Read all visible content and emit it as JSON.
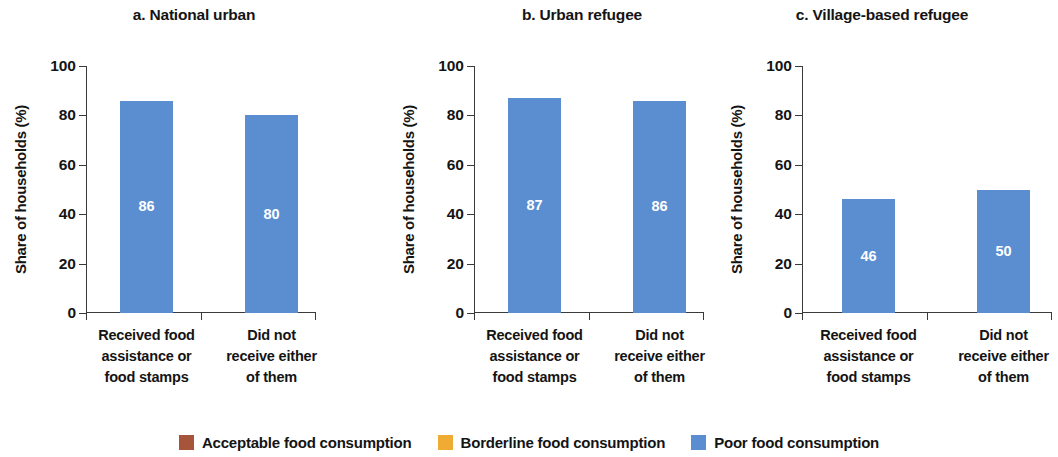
{
  "chart_data": {
    "type": "bar",
    "subtype": "stacked-100-percent",
    "title": "",
    "panels": [
      {
        "label": "a. National urban",
        "ylabel": "Share of households (%)",
        "categories": [
          "Received food\nassistance or\nfood stamps",
          "Did not\nreceive either\nof them"
        ],
        "series": [
          {
            "name": "Acceptable food consumption",
            "values": [
              4,
              8
            ]
          },
          {
            "name": "Borderline food consumption",
            "values": [
              10,
              12
            ]
          },
          {
            "name": "Poor food consumption",
            "values": [
              86,
              80
            ]
          }
        ]
      },
      {
        "label": "b. Urban refugee",
        "ylabel": "Share of households (%)",
        "categories": [
          "Received food\nassistance or\nfood stamps",
          "Did not\nreceive either\nof them"
        ],
        "series": [
          {
            "name": "Acceptable food consumption",
            "values": [
              6,
              7
            ]
          },
          {
            "name": "Borderline food consumption",
            "values": [
              8,
              7
            ]
          },
          {
            "name": "Poor food consumption",
            "values": [
              87,
              86
            ]
          }
        ]
      },
      {
        "label": "c. Village-based refugee",
        "ylabel": "Share of households (%)",
        "categories": [
          "Received food\nassistance or\nfood stamps",
          "Did not\nreceive either\nof them"
        ],
        "series": [
          {
            "name": "Acceptable food consumption",
            "values": [
              34,
              46
            ]
          },
          {
            "name": "Borderline food consumption",
            "values": [
              19,
              4
            ]
          },
          {
            "name": "Poor food consumption",
            "values": [
              46,
              50
            ]
          }
        ]
      }
    ],
    "ylim": [
      0,
      100
    ],
    "yticks": [
      0,
      20,
      40,
      60,
      80,
      100
    ],
    "ytick_labels": [
      "0",
      "20",
      "40",
      "60",
      "80",
      "100"
    ],
    "xlabel": "",
    "ylabel": "Share of households (%)",
    "grid": false,
    "legend_position": "bottom",
    "legend": [
      {
        "label": "Acceptable food consumption",
        "color": "#a6553b"
      },
      {
        "label": "Borderline food consumption",
        "color": "#f0ac32"
      },
      {
        "label": "Poor food consumption",
        "color": "#5b8ed1"
      }
    ],
    "colors": {
      "acceptable": "#a6553b",
      "borderline": "#f0ac32",
      "poor": "#5b8ed1",
      "axis": "#3a3a3a",
      "text": "#141414"
    }
  }
}
